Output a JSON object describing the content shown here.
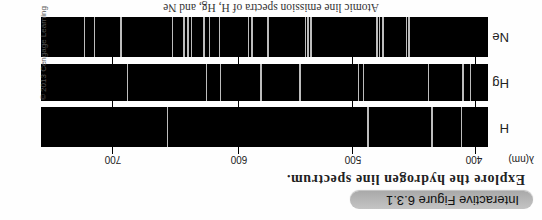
{
  "header": {
    "figure_label": "Interactive Figure 6.3.1",
    "subtitle": "Explore the hydrogen line spectrum."
  },
  "axis": {
    "unit_label": "λ(nm)",
    "ticks": [
      {
        "label": "400",
        "nm": 400
      },
      {
        "label": "500",
        "nm": 500
      },
      {
        "label": "600",
        "nm": 600
      },
      {
        "label": "700",
        "nm": 700
      }
    ]
  },
  "spectra": [
    {
      "label": "H",
      "lines_nm": [
        411,
        435,
        487,
        656
      ]
    },
    {
      "label": "Hg",
      "lines_nm": [
        404,
        410,
        438,
        491,
        495,
        546,
        580,
        614,
        625,
        688
      ]
    },
    {
      "label": "Ne",
      "lines_nm": [
        454,
        456,
        475,
        478,
        480,
        536,
        539,
        541,
        574,
        588,
        591,
        615,
        623,
        627,
        637,
        640,
        643,
        652,
        693,
        714,
        722
      ]
    }
  ],
  "caption": "Atomic line emission spectra of H, Hg, and Ne",
  "copyright": "© 2013 Cengage Learning",
  "colors": {
    "bar": "#000000",
    "line": "#bdbdbd",
    "pill": "#b4b4b4"
  }
}
